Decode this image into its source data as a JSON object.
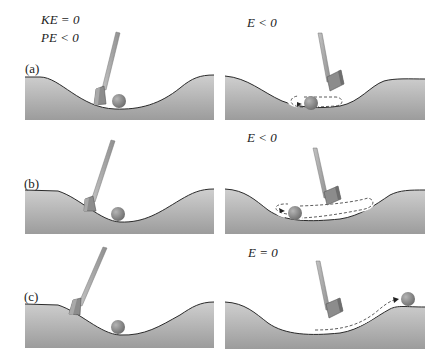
{
  "figure": {
    "rows": [
      {
        "id": "a",
        "panel_label": "(a)",
        "left": {
          "energy_lines": [
            "KE = 0",
            "PE < 0"
          ]
        },
        "right": {
          "energy_label": "E < 0",
          "motion": "ball oscillates in small loop near valley bottom"
        }
      },
      {
        "id": "b",
        "panel_label": "(b)",
        "left": {
          "energy_lines": []
        },
        "right": {
          "energy_label": "E < 0",
          "motion": "ball oscillates in larger loop across valley"
        }
      },
      {
        "id": "c",
        "panel_label": "(c)",
        "left": {
          "energy_lines": []
        },
        "right": {
          "energy_label": "E = 0",
          "motion": "ball escapes valley onto the right plateau"
        }
      }
    ],
    "colors": {
      "ground_top": "#c9c9c9",
      "ground_bottom": "#9a9a9a",
      "ground_edge": "#2a2a2a",
      "club_shaft": "#a8a8a8",
      "club_head": "#8c8c8c",
      "ball": "#8a8a8a",
      "dashed_path": "#333333"
    }
  }
}
